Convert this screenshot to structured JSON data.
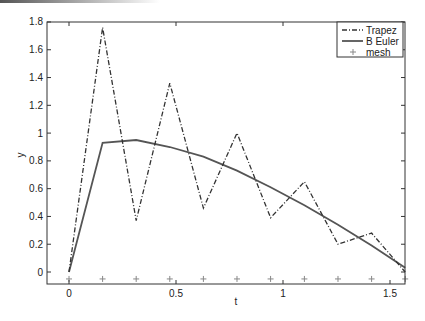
{
  "chart_data": {
    "type": "line",
    "title": "",
    "xlabel": "t",
    "ylabel": "y",
    "xlim": [
      0,
      1.5708
    ],
    "ylim": [
      -0.09,
      1.8
    ],
    "grid": false,
    "legend_position": "upper right",
    "x_ticks": [
      0,
      0.5,
      1,
      1.5
    ],
    "x_tick_labels": [
      "0",
      "0.5",
      "1",
      "1.5"
    ],
    "y_ticks": [
      0,
      0.2,
      0.4,
      0.6,
      0.8,
      1,
      1.2,
      1.4,
      1.6,
      1.8
    ],
    "y_tick_labels": [
      "0",
      "0.2",
      "0.4",
      "0.6",
      "0.8",
      "1",
      "1.2",
      "1.4",
      "1.6",
      "1.8"
    ],
    "x": [
      0,
      0.157,
      0.314,
      0.471,
      0.628,
      0.785,
      0.942,
      1.1,
      1.257,
      1.414,
      1.571
    ],
    "series": [
      {
        "name": "Trapez",
        "style": "dash-dot",
        "values": [
          0,
          1.76,
          0.37,
          1.36,
          0.46,
          1.0,
          0.39,
          0.65,
          0.2,
          0.28,
          0.0
        ]
      },
      {
        "name": "B Euler",
        "style": "solid",
        "values": [
          0,
          0.93,
          0.95,
          0.9,
          0.83,
          0.73,
          0.61,
          0.48,
          0.34,
          0.19,
          0.03
        ]
      },
      {
        "name": "mesh",
        "style": "plus-markers",
        "values": [
          -0.05,
          -0.05,
          -0.05,
          -0.05,
          -0.05,
          -0.05,
          -0.05,
          -0.05,
          -0.05,
          -0.05,
          -0.05
        ]
      }
    ],
    "legend": [
      "Trapez",
      "B Euler",
      "mesh"
    ]
  },
  "colors": {
    "axis": "#333333",
    "trapez": "#333333",
    "beuler": "#555555",
    "mesh": "#888888"
  }
}
